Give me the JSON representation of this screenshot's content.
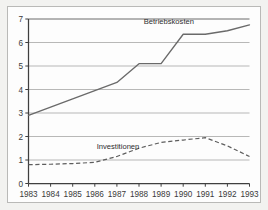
{
  "chart_data": {
    "type": "line",
    "title": "",
    "xlabel": "",
    "ylabel": "",
    "x": [
      1983,
      1984,
      1985,
      1986,
      1987,
      1988,
      1989,
      1990,
      1991,
      1992,
      1993
    ],
    "categories": [
      "1983",
      "1984",
      "1985",
      "1986",
      "1987",
      "1988",
      "1989",
      "1990",
      "1991",
      "1992",
      "1993"
    ],
    "xlim": [
      1983,
      1993
    ],
    "ylim": [
      0,
      7
    ],
    "yticks": [
      "0",
      "1",
      "2",
      "3",
      "4",
      "5",
      "6",
      "7"
    ],
    "ytick_values": [
      0,
      1,
      2,
      3,
      4,
      5,
      6,
      7
    ],
    "grid": true,
    "grid_axis": "y",
    "legend_position": "inline-annotation",
    "series": [
      {
        "name": "Betriebskosten",
        "style": "solid",
        "color": "#6a6a6a",
        "label_x": 1989.35,
        "label_y": 6.78,
        "values": [
          2.9,
          3.25,
          3.6,
          3.95,
          4.3,
          5.1,
          5.1,
          6.35,
          6.35,
          6.5,
          6.75
        ]
      },
      {
        "name": "Investitionen",
        "style": "dashed",
        "color": "#5d5d5d",
        "label_x": 1987.05,
        "label_y": 1.48,
        "values": [
          0.8,
          0.82,
          0.85,
          0.9,
          1.15,
          1.5,
          1.75,
          1.85,
          1.95,
          1.6,
          1.15
        ]
      }
    ]
  }
}
